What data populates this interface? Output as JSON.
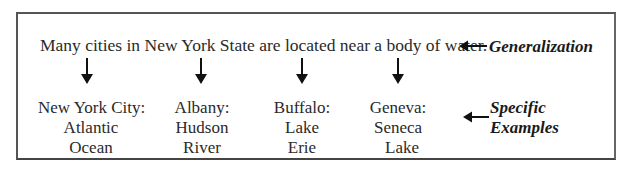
{
  "generalization": {
    "sentence": "Many cities in New York State are located near a body of water.",
    "arrow": "⟵",
    "label": "Generalization"
  },
  "specific": {
    "arrow": "⟵",
    "label_line1": "Specific",
    "label_line2": "Examples"
  },
  "examples": [
    {
      "city": "New York City:",
      "water_line1": "Atlantic",
      "water_line2": "Ocean"
    },
    {
      "city": "Albany:",
      "water_line1": "Hudson",
      "water_line2": "River"
    },
    {
      "city": "Buffalo:",
      "water_line1": "Lake",
      "water_line2": "Erie"
    },
    {
      "city": "Geneva:",
      "water_line1": "Seneca",
      "water_line2": "Lake"
    }
  ]
}
